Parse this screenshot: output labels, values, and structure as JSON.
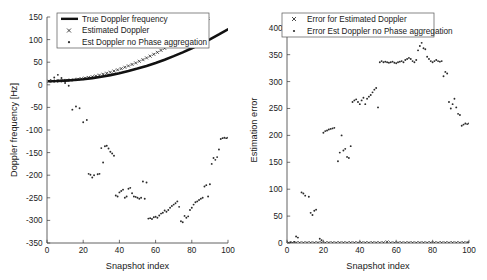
{
  "chart_data": [
    {
      "type": "scatter",
      "panel": "left",
      "title": "",
      "xlabel": "Snapshot index",
      "ylabel": "Doppler frequency [Hz]",
      "xlim": [
        0,
        100
      ],
      "ylim": [
        -350,
        150
      ],
      "xticks": [
        0,
        20,
        40,
        60,
        80,
        100
      ],
      "yticks": [
        -350,
        -300,
        -250,
        -200,
        -150,
        -100,
        -50,
        0,
        50,
        100,
        150
      ],
      "grid": false,
      "legend_position": "top-left",
      "legend": [
        {
          "label": "True Doppler frequency",
          "marker": "line"
        },
        {
          "label": "Estimated Doppler",
          "marker": "x"
        },
        {
          "label": "Est Doppler no Phase aggregation",
          "marker": "dot"
        }
      ],
      "series": [
        {
          "name": "True Doppler frequency",
          "marker": "line",
          "x": [
            1,
            5,
            10,
            15,
            20,
            25,
            30,
            35,
            40,
            45,
            50,
            55,
            60,
            65,
            70,
            75,
            80,
            85,
            90,
            95,
            100
          ],
          "values": [
            8,
            8.3,
            9.2,
            10.5,
            12.4,
            14.8,
            17.8,
            21.4,
            25.6,
            30.4,
            35.8,
            41.8,
            48.4,
            55.6,
            63.4,
            71.8,
            80.8,
            90.4,
            100.6,
            111.4,
            122.8
          ]
        },
        {
          "name": "Estimated Doppler",
          "marker": "x",
          "x": [
            1,
            3,
            5,
            7,
            9,
            11,
            13,
            15,
            17,
            19,
            21,
            23,
            25,
            27,
            29,
            31,
            33,
            35,
            37,
            39,
            41,
            43,
            45,
            47,
            49,
            51,
            53,
            55,
            57,
            59,
            61,
            63,
            65,
            67,
            69,
            71,
            73,
            75,
            77,
            79,
            81,
            83,
            85,
            87,
            89,
            91,
            93,
            95,
            97,
            99,
            100
          ],
          "values": [
            8,
            8.1,
            8.3,
            8.7,
            9.2,
            9.8,
            10.5,
            11.4,
            12.4,
            13.5,
            14.8,
            16.2,
            17.8,
            19.5,
            21.4,
            23.4,
            25.6,
            27.9,
            30.4,
            33.0,
            35.8,
            38.8,
            41.8,
            45.1,
            48.4,
            52.0,
            55.6,
            59.5,
            63.4,
            67.5,
            71.8,
            76.2,
            80.8,
            85.5,
            90.4,
            95.4,
            100.6,
            105.9,
            111.4,
            117.0,
            122.8,
            128.7,
            134.8,
            141.0,
            147.4,
            153.9,
            160.6,
            167.4,
            174.4,
            181.5,
            185.0
          ]
        },
        {
          "name": "Est Doppler no Phase aggregation",
          "marker": "dot",
          "x": [
            2,
            4,
            6,
            8,
            10,
            12,
            14,
            16,
            18,
            20,
            22,
            23,
            24,
            25,
            26,
            28,
            29,
            30,
            31,
            32,
            33,
            34,
            35,
            36,
            37,
            38,
            39,
            40,
            41,
            42,
            43,
            44,
            45,
            46,
            47,
            48,
            49,
            50,
            51,
            52,
            53,
            54,
            55,
            56,
            57,
            58,
            59,
            60,
            61,
            62,
            63,
            64,
            65,
            66,
            67,
            68,
            69,
            70,
            71,
            72,
            73,
            74,
            75,
            76,
            77,
            78,
            79,
            80,
            81,
            82,
            83,
            84,
            85,
            86,
            87,
            88,
            89,
            90,
            91,
            92,
            93,
            94,
            95,
            96,
            97,
            98,
            99,
            100
          ],
          "values": [
            10,
            16,
            22,
            15,
            4,
            -2,
            -55,
            -48,
            -52,
            -83,
            -78,
            -197,
            -199,
            -205,
            -200,
            -198,
            -197,
            -140,
            -172,
            -136,
            -135,
            -141,
            -148,
            -152,
            -157,
            -245,
            -247,
            -238,
            -235,
            -232,
            -250,
            -247,
            -230,
            -228,
            -240,
            -247,
            -248,
            -250,
            -252,
            -250,
            -214,
            -252,
            -216,
            -296,
            -295,
            -297,
            -293,
            -292,
            -294,
            -289,
            -285,
            -283,
            -278,
            -281,
            -277,
            -272,
            -268,
            -265,
            -262,
            -258,
            -270,
            -302,
            -304,
            -290,
            -294,
            -291,
            -277,
            -272,
            -265,
            -260,
            -258,
            -255,
            -252,
            -250,
            -225,
            -222,
            -247,
            -220,
            -175,
            -162,
            -166,
            -160,
            -143,
            -120,
            -118,
            -117,
            -118,
            -117
          ]
        }
      ]
    },
    {
      "type": "scatter",
      "panel": "right",
      "title": "",
      "xlabel": "Snapshot index",
      "ylabel": "Estimation error",
      "xlim": [
        0,
        100
      ],
      "ylim": [
        0,
        420
      ],
      "xticks": [
        0,
        20,
        40,
        60,
        80,
        100
      ],
      "yticks": [
        0,
        50,
        100,
        150,
        200,
        250,
        300,
        350,
        400
      ],
      "grid": false,
      "legend_position": "top-left",
      "legend": [
        {
          "label": "Error for Estimated Doppler",
          "marker": "x"
        },
        {
          "label": "Error Est Doppler no Phase aggregation",
          "marker": "dot"
        }
      ],
      "series": [
        {
          "name": "Error for Estimated Doppler",
          "marker": "x",
          "x": [
            1,
            3,
            5,
            7,
            9,
            11,
            13,
            15,
            17,
            19,
            21,
            23,
            25,
            27,
            29,
            31,
            33,
            35,
            37,
            39,
            41,
            43,
            45,
            47,
            49,
            51,
            53,
            55,
            57,
            59,
            61,
            63,
            65,
            67,
            69,
            71,
            73,
            75,
            77,
            79,
            81,
            83,
            85,
            87,
            89,
            91,
            93,
            95,
            97,
            99,
            100
          ],
          "values": [
            0.5,
            0.4,
            0.6,
            0.5,
            0.4,
            0.6,
            0.5,
            0.4,
            0.6,
            0.5,
            0.4,
            0.6,
            0.5,
            0.4,
            0.6,
            0.5,
            0.4,
            0.6,
            0.5,
            0.4,
            0.6,
            0.5,
            0.4,
            0.6,
            0.5,
            0.4,
            0.6,
            2.0,
            0.5,
            0.4,
            0.6,
            0.5,
            0.4,
            0.6,
            0.5,
            0.4,
            0.6,
            0.5,
            0.4,
            0.6,
            0.5,
            0.4,
            0.6,
            0.5,
            0.4,
            0.6,
            0.5,
            0.4,
            0.6,
            0.5,
            0.4
          ]
        },
        {
          "name": "Error Est Doppler no Phase aggregation",
          "marker": "dot",
          "x": [
            2,
            4,
            5,
            6,
            8,
            9,
            10,
            12,
            13,
            14,
            15,
            16,
            18,
            19,
            20,
            21,
            22,
            23,
            24,
            25,
            26,
            28,
            29,
            30,
            31,
            32,
            33,
            34,
            35,
            36,
            37,
            38,
            39,
            40,
            41,
            42,
            43,
            44,
            45,
            46,
            47,
            48,
            49,
            50,
            51,
            52,
            53,
            54,
            55,
            56,
            57,
            58,
            59,
            60,
            61,
            62,
            63,
            64,
            65,
            66,
            67,
            68,
            69,
            70,
            71,
            72,
            73,
            74,
            75,
            76,
            77,
            78,
            79,
            80,
            81,
            82,
            83,
            84,
            85,
            86,
            87,
            88,
            89,
            90,
            91,
            92,
            93,
            94,
            95,
            96,
            97,
            98,
            99,
            100
          ],
          "values": [
            1,
            2,
            12,
            10,
            94,
            92,
            88,
            86,
            56,
            52,
            60,
            62,
            8,
            5,
            205,
            208,
            209,
            211,
            212,
            213,
            214,
            152,
            168,
            200,
            172,
            175,
            160,
            158,
            180,
            262,
            265,
            267,
            262,
            258,
            265,
            270,
            258,
            268,
            272,
            275,
            280,
            285,
            288,
            252,
            336,
            338,
            336,
            337,
            336,
            335,
            336,
            337,
            335,
            334,
            336,
            337,
            338,
            336,
            340,
            342,
            344,
            342,
            338,
            336,
            340,
            358,
            366,
            372,
            362,
            360,
            346,
            342,
            338,
            336,
            338,
            340,
            338,
            337,
            338,
            310,
            318,
            315,
            262,
            250,
            258,
            268,
            252,
            240,
            238,
            218,
            220,
            222,
            221,
            222
          ]
        }
      ]
    }
  ]
}
